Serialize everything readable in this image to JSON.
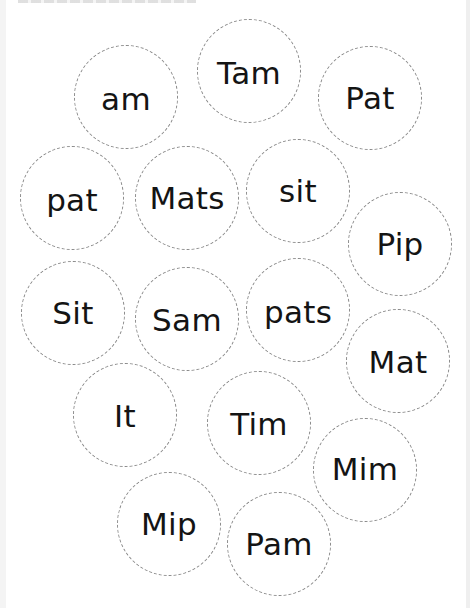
{
  "worksheet": {
    "title_visible": "",
    "colors": {
      "text": "#141414",
      "dashed_border": "#8a8a8a",
      "background": "#ffffff"
    },
    "bubbles": [
      {
        "word": "am",
        "cx": 126,
        "cy": 97,
        "dy": 2
      },
      {
        "word": "Tam",
        "cx": 249,
        "cy": 71,
        "dy": 2
      },
      {
        "word": "Pat",
        "cx": 370,
        "cy": 98,
        "dy": 0
      },
      {
        "word": "pat",
        "cx": 72,
        "cy": 198,
        "dy": 2
      },
      {
        "word": "Mats",
        "cx": 187,
        "cy": 198,
        "dy": 0
      },
      {
        "word": "sit",
        "cx": 298,
        "cy": 191,
        "dy": 0
      },
      {
        "word": "Pip",
        "cx": 400,
        "cy": 244,
        "dy": 0
      },
      {
        "word": "Sit",
        "cx": 73,
        "cy": 313,
        "dy": 0
      },
      {
        "word": "Sam",
        "cx": 187,
        "cy": 319,
        "dy": 1
      },
      {
        "word": "pats",
        "cx": 298,
        "cy": 310,
        "dy": 2
      },
      {
        "word": "Mat",
        "cx": 398,
        "cy": 361,
        "dy": 1
      },
      {
        "word": "It",
        "cx": 125,
        "cy": 415,
        "dy": 1
      },
      {
        "word": "Tim",
        "cx": 259,
        "cy": 423,
        "dy": 1
      },
      {
        "word": "Mim",
        "cx": 365,
        "cy": 470,
        "dy": -1
      },
      {
        "word": "Mip",
        "cx": 169,
        "cy": 524,
        "dy": 0
      },
      {
        "word": "Pam",
        "cx": 279,
        "cy": 544,
        "dy": 0
      }
    ]
  }
}
